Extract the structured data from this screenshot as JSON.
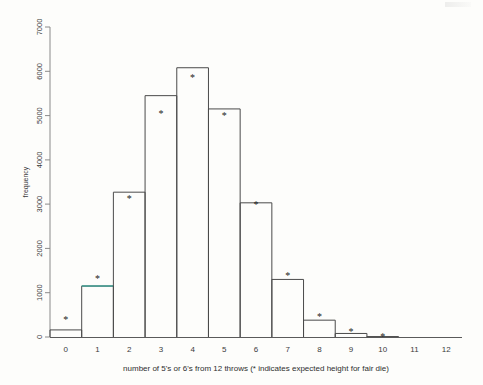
{
  "chart_data": {
    "type": "bar",
    "title": "",
    "subtitle": "",
    "xlabel": "number of 5's or 6's from 12 throws (* indicates expected height for fair die)",
    "ylabel": "frequency",
    "categories": [
      "0",
      "1",
      "2",
      "3",
      "4",
      "5",
      "6",
      "7",
      "8",
      "9",
      "10",
      "11",
      "12"
    ],
    "values": [
      160,
      1150,
      3270,
      5450,
      6080,
      5150,
      3030,
      1300,
      380,
      80,
      10,
      0,
      0
    ],
    "series": [
      {
        "name": "observed frequency",
        "values": [
          160,
          1150,
          3270,
          5450,
          6080,
          5150,
          3030,
          1300,
          380,
          80,
          10,
          0,
          0
        ]
      },
      {
        "name": "expected height for fair die",
        "marker": "*",
        "values": [
          390,
          1320,
          3130,
          5050,
          5870,
          5000,
          3000,
          1380,
          460,
          115,
          20,
          0,
          0
        ]
      }
    ],
    "ylim": [
      0,
      7000
    ],
    "xlim": [
      -0.5,
      12.5
    ],
    "yticks": [
      0,
      1000,
      2000,
      3000,
      4000,
      5000,
      6000,
      7000
    ],
    "ytick_labels": [
      "0",
      "1000",
      "2000",
      "3000",
      "4000",
      "5000",
      "6000",
      "7000"
    ],
    "xtick_labels": [
      "0",
      "1",
      "2",
      "3",
      "4",
      "5",
      "6",
      "7",
      "8",
      "9",
      "10",
      "11",
      "12"
    ],
    "grid": false,
    "legend": "none",
    "annotations": [
      {
        "label": "*",
        "meaning": "expected height for fair die"
      }
    ],
    "highlight": {
      "category": "1",
      "color": "#3f9e92",
      "note": "top edge of bar at x=1 drawn in teal"
    },
    "colors": {
      "bar_stroke": "#4a4a4a",
      "axis": "#8a8a8a",
      "text": "#3b3b3b",
      "highlight": "#3f9e92",
      "background": "#fdfdfb"
    }
  },
  "axis": {
    "y_title": "frequency",
    "x_title": "number of 5's or 6's from 12 throws (* indicates expected height for fair die)"
  }
}
